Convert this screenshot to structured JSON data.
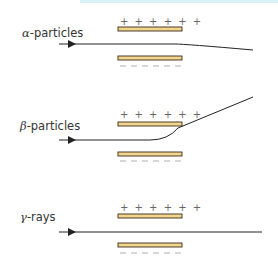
{
  "colors": {
    "plate_fill": "#f2d58f",
    "plate_stroke": "#3a2a10",
    "path": "#222222",
    "charge": "#666666",
    "topband": "#d7f1f7"
  },
  "panels": [
    {
      "symbol": "α",
      "suffix": "-particles",
      "deflection": "toward negative plate (slight)"
    },
    {
      "symbol": "β",
      "suffix": "-particles",
      "deflection": "toward positive plate (strong)"
    },
    {
      "symbol": "γ",
      "suffix": "-rays",
      "deflection": "none"
    }
  ],
  "charges": {
    "positive": "+ + + + + +",
    "negative": "— — — — — —"
  }
}
